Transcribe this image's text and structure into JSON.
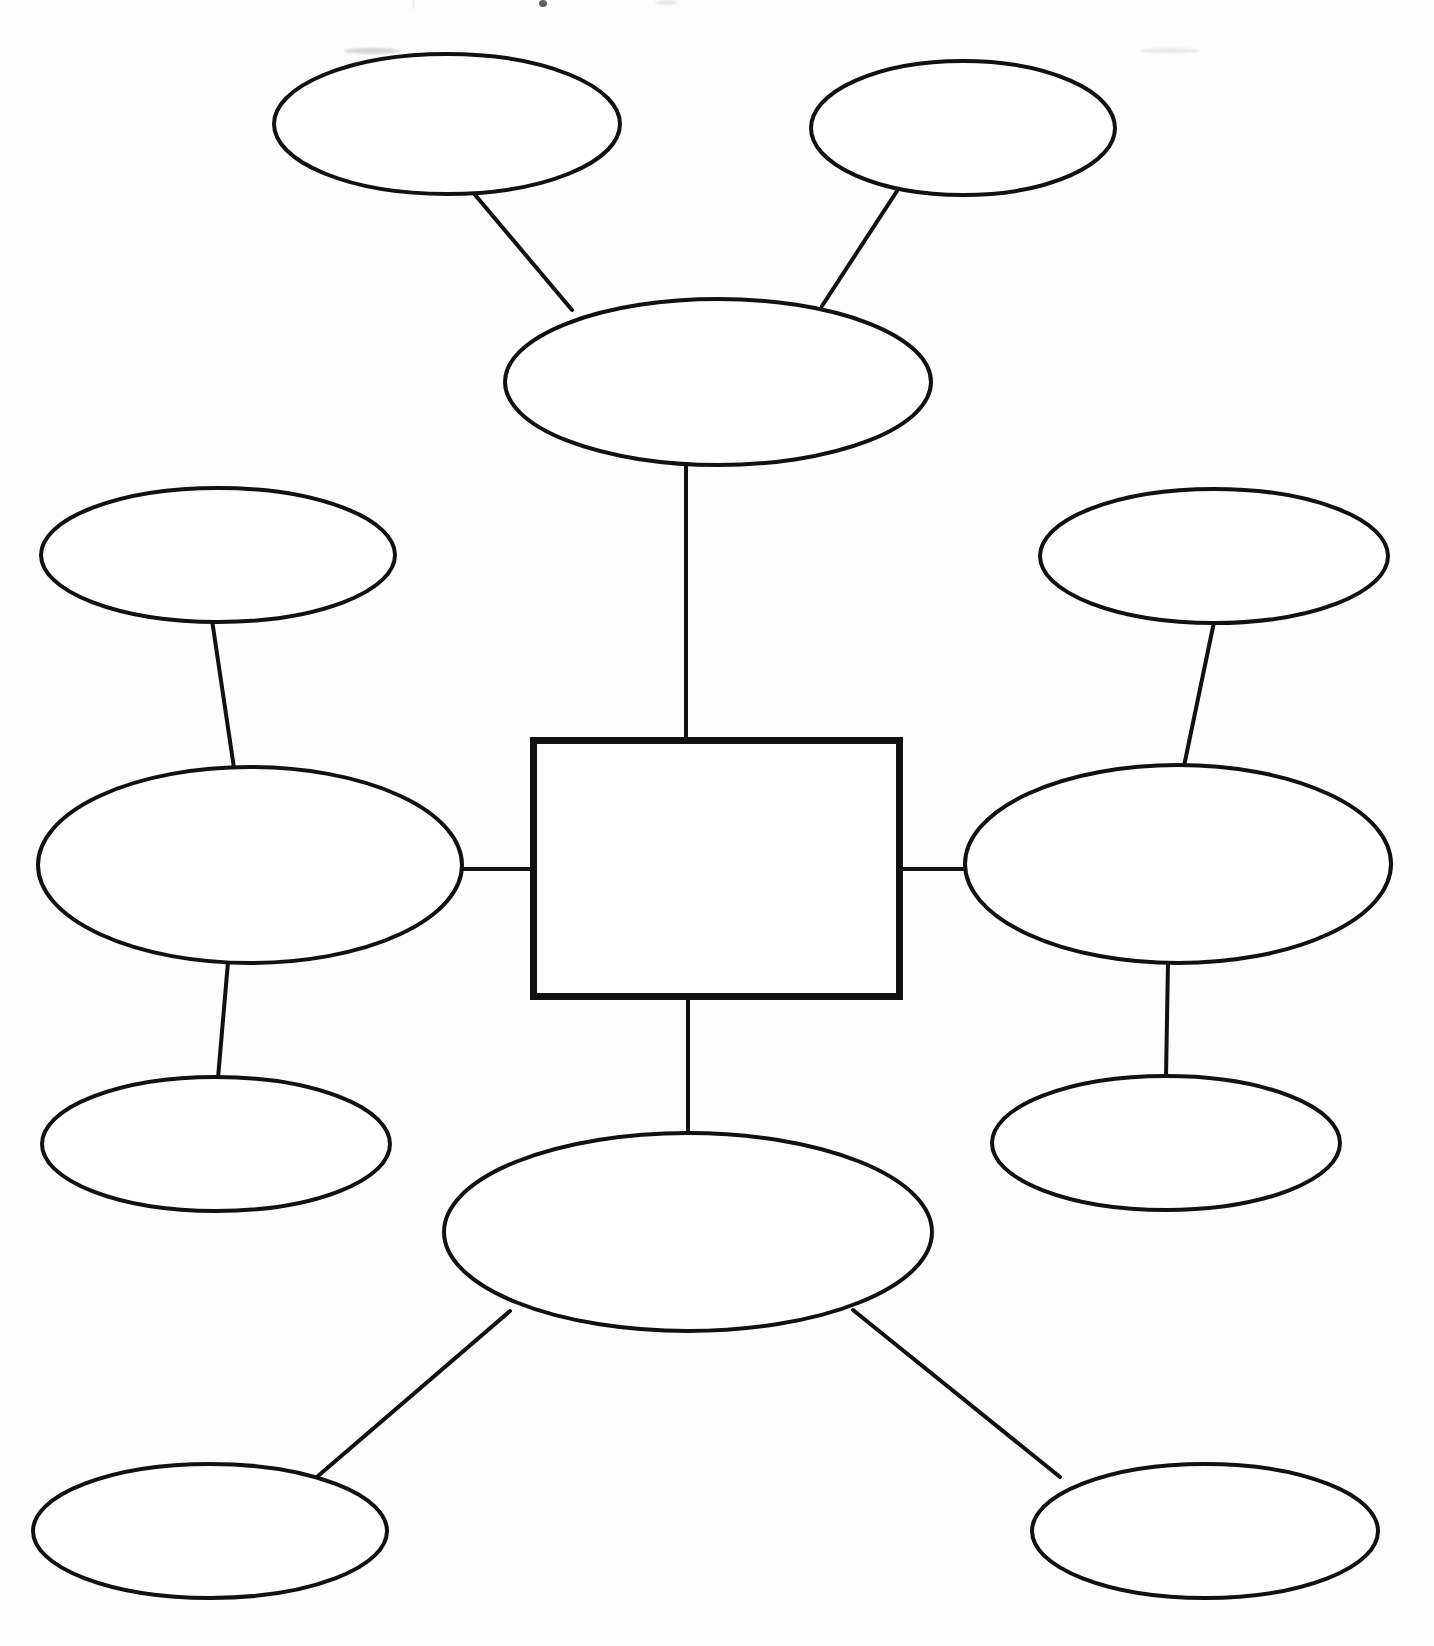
{
  "document": {
    "kind": "concept-map-worksheet",
    "title": "",
    "background_color": "#fdfdfd",
    "ink_color": "#111111",
    "canvas": {
      "width": 1434,
      "height": 1646
    }
  },
  "center": {
    "shape": "rectangle",
    "label": "",
    "x": 530,
    "y": 737,
    "width": 373,
    "height": 263,
    "stroke_width": 7,
    "stroke_color": "#111111",
    "fill_color": "#ffffff"
  },
  "nodes": [
    {
      "id": "primary-top",
      "role": "primary",
      "shape": "ellipse",
      "label": "",
      "cx": 718,
      "cy": 382,
      "rx": 213,
      "ry": 83,
      "stroke_width": 4,
      "stroke_color": "#111111",
      "fill_color": "#ffffff"
    },
    {
      "id": "primary-left",
      "role": "primary",
      "shape": "ellipse",
      "label": "",
      "cx": 250,
      "cy": 865,
      "rx": 212,
      "ry": 98,
      "stroke_width": 4,
      "stroke_color": "#111111",
      "fill_color": "#ffffff"
    },
    {
      "id": "primary-right",
      "role": "primary",
      "shape": "ellipse",
      "label": "",
      "cx": 1178,
      "cy": 864,
      "rx": 213,
      "ry": 99,
      "stroke_width": 4,
      "stroke_color": "#111111",
      "fill_color": "#ffffff"
    },
    {
      "id": "primary-bottom",
      "role": "primary",
      "shape": "ellipse",
      "label": "",
      "cx": 688,
      "cy": 1232,
      "rx": 244,
      "ry": 99,
      "stroke_width": 4,
      "stroke_color": "#111111",
      "fill_color": "#ffffff"
    },
    {
      "id": "secondary-top-left",
      "role": "secondary",
      "shape": "ellipse",
      "label": "",
      "cx": 447,
      "cy": 124,
      "rx": 173,
      "ry": 70,
      "stroke_width": 4,
      "stroke_color": "#111111",
      "fill_color": "#ffffff"
    },
    {
      "id": "secondary-top-right",
      "role": "secondary",
      "shape": "ellipse",
      "label": "",
      "cx": 963,
      "cy": 128,
      "rx": 152,
      "ry": 67,
      "stroke_width": 4,
      "stroke_color": "#111111",
      "fill_color": "#ffffff"
    },
    {
      "id": "secondary-left-upper",
      "role": "secondary",
      "shape": "ellipse",
      "label": "",
      "cx": 218,
      "cy": 555,
      "rx": 177,
      "ry": 67,
      "stroke_width": 4,
      "stroke_color": "#111111",
      "fill_color": "#ffffff"
    },
    {
      "id": "secondary-left-lower",
      "role": "secondary",
      "shape": "ellipse",
      "label": "",
      "cx": 216,
      "cy": 1144,
      "rx": 174,
      "ry": 67,
      "stroke_width": 4,
      "stroke_color": "#111111",
      "fill_color": "#ffffff"
    },
    {
      "id": "secondary-right-upper",
      "role": "secondary",
      "shape": "ellipse",
      "label": "",
      "cx": 1214,
      "cy": 556,
      "rx": 174,
      "ry": 67,
      "stroke_width": 4,
      "stroke_color": "#111111",
      "fill_color": "#ffffff"
    },
    {
      "id": "secondary-right-lower",
      "role": "secondary",
      "shape": "ellipse",
      "label": "",
      "cx": 1166,
      "cy": 1143,
      "rx": 174,
      "ry": 67,
      "stroke_width": 4,
      "stroke_color": "#111111",
      "fill_color": "#ffffff"
    },
    {
      "id": "secondary-bottom-left",
      "role": "secondary",
      "shape": "ellipse",
      "label": "",
      "cx": 210,
      "cy": 1531,
      "rx": 177,
      "ry": 67,
      "stroke_width": 4,
      "stroke_color": "#111111",
      "fill_color": "#ffffff"
    },
    {
      "id": "secondary-bottom-right",
      "role": "secondary",
      "shape": "ellipse",
      "label": "",
      "cx": 1205,
      "cy": 1531,
      "rx": 173,
      "ry": 67,
      "stroke_width": 4,
      "stroke_color": "#111111",
      "fill_color": "#ffffff"
    }
  ],
  "connectors": [
    {
      "id": "connector-center-top",
      "from": "center",
      "to": "primary-top",
      "x1": 686,
      "y1": 737,
      "x2": 686,
      "y2": 466,
      "stroke_width": 4
    },
    {
      "id": "connector-center-bottom",
      "from": "center",
      "to": "primary-bottom",
      "x1": 688,
      "y1": 1000,
      "x2": 688,
      "y2": 1134,
      "stroke_width": 4
    },
    {
      "id": "connector-center-left",
      "from": "center",
      "to": "primary-left",
      "x1": 530,
      "y1": 869,
      "x2": 462,
      "y2": 869,
      "stroke_width": 4
    },
    {
      "id": "connector-center-right",
      "from": "center",
      "to": "primary-right",
      "x1": 903,
      "y1": 869,
      "x2": 966,
      "y2": 869,
      "stroke_width": 4
    },
    {
      "id": "connector-top-to-topleft",
      "from": "primary-top",
      "to": "secondary-top-left",
      "x1": 572,
      "y1": 310,
      "x2": 471,
      "y2": 190,
      "stroke_width": 4
    },
    {
      "id": "connector-top-to-topright",
      "from": "primary-top",
      "to": "secondary-top-right",
      "x1": 822,
      "y1": 306,
      "x2": 897,
      "y2": 191,
      "stroke_width": 4
    },
    {
      "id": "connector-left-to-upper",
      "from": "primary-left",
      "to": "secondary-left-upper",
      "x1": 234,
      "y1": 768,
      "x2": 212,
      "y2": 620,
      "stroke_width": 4
    },
    {
      "id": "connector-left-to-lower",
      "from": "primary-left",
      "to": "secondary-left-lower",
      "x1": 228,
      "y1": 962,
      "x2": 218,
      "y2": 1078,
      "stroke_width": 4
    },
    {
      "id": "connector-right-to-upper",
      "from": "primary-right",
      "to": "secondary-right-upper",
      "x1": 1184,
      "y1": 766,
      "x2": 1214,
      "y2": 622,
      "stroke_width": 4
    },
    {
      "id": "connector-right-to-lower",
      "from": "primary-right",
      "to": "secondary-right-lower",
      "x1": 1168,
      "y1": 962,
      "x2": 1166,
      "y2": 1077,
      "stroke_width": 4
    },
    {
      "id": "connector-bottom-to-left",
      "from": "primary-bottom",
      "to": "secondary-bottom-left",
      "x1": 510,
      "y1": 1311,
      "x2": 318,
      "y2": 1476,
      "stroke_width": 4
    },
    {
      "id": "connector-bottom-to-right",
      "from": "primary-bottom",
      "to": "secondary-bottom-right",
      "x1": 853,
      "y1": 1310,
      "x2": 1060,
      "y2": 1477,
      "stroke_width": 4
    }
  ]
}
